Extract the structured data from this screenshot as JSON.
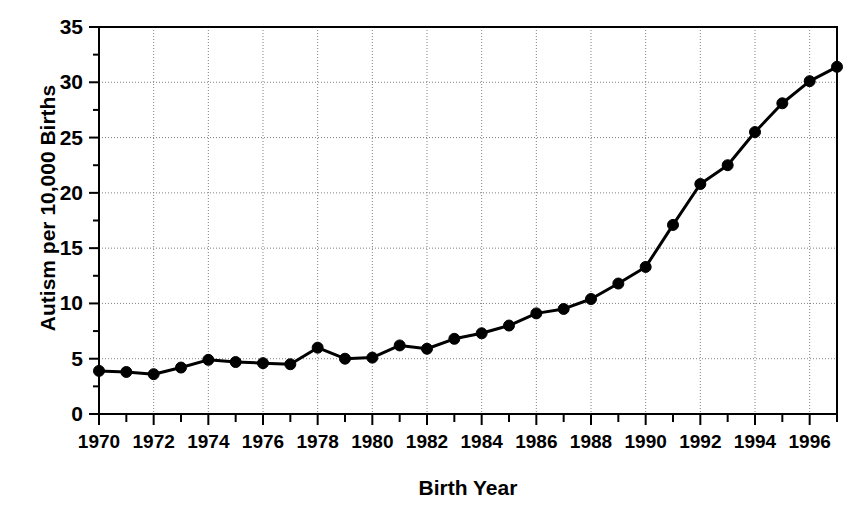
{
  "chart_data": {
    "type": "line",
    "title": "",
    "xlabel": "Birth Year",
    "ylabel": "Autism per 10,000 Births",
    "xlim": [
      1970,
      1997
    ],
    "ylim": [
      0,
      35
    ],
    "grid": true,
    "legend": "none",
    "marker": "filled-circle",
    "line_color": "#000000",
    "marker_color": "#000000",
    "grid_color": "#808080",
    "axis_color": "#000000",
    "y_ticks": [
      0,
      5,
      10,
      15,
      20,
      25,
      30,
      35
    ],
    "y_tick_labels": [
      "0",
      "5",
      "10",
      "15",
      "20",
      "25",
      "30",
      "35"
    ],
    "y_minor_tick_interval": 2.5,
    "x_ticks": [
      1970,
      1972,
      1974,
      1976,
      1978,
      1980,
      1982,
      1984,
      1986,
      1988,
      1990,
      1992,
      1994,
      1996
    ],
    "x_tick_labels": [
      "1970",
      "1972",
      "1974",
      "1976",
      "1978",
      "1980",
      "1982",
      "1984",
      "1986",
      "1988",
      "1990",
      "1992",
      "1994",
      "1996"
    ],
    "x_minor_tick_interval": 1,
    "x": [
      1970,
      1971,
      1972,
      1973,
      1974,
      1975,
      1976,
      1977,
      1978,
      1979,
      1980,
      1981,
      1982,
      1983,
      1984,
      1985,
      1986,
      1987,
      1988,
      1989,
      1990,
      1991,
      1992,
      1993,
      1994,
      1995,
      1996,
      1997
    ],
    "values": [
      3.9,
      3.8,
      3.6,
      4.2,
      4.9,
      4.7,
      4.6,
      4.5,
      6.0,
      5.0,
      5.1,
      6.2,
      5.9,
      6.8,
      7.3,
      8.0,
      9.1,
      9.5,
      10.4,
      11.8,
      13.3,
      17.1,
      20.8,
      22.5,
      25.5,
      28.1,
      30.1,
      31.4
    ],
    "series_name": "Autism per 10,000 Births"
  }
}
